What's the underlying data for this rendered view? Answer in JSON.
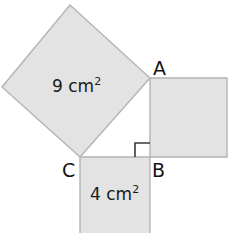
{
  "diagram": {
    "background_color": "#ffffff",
    "shape_fill": "#e3e3e3",
    "shape_stroke": "#b4b4b4",
    "label_color": "#141414",
    "squares": [
      {
        "name": "hypotenuse-square",
        "label": "9 cm",
        "exponent": "2",
        "points": "70,5 150,78 80,157 2,87",
        "label_x": 52,
        "label_y": 92
      },
      {
        "name": "vertical-leg-square",
        "label": "",
        "exponent": "",
        "points": "150,78 227,78 227,157 150,157",
        "label_x": 0,
        "label_y": 0
      },
      {
        "name": "horizontal-leg-square",
        "label": "4 cm",
        "exponent": "2",
        "points": "80,157 150,157 150,236 80,236",
        "label_x": 90,
        "label_y": 200
      }
    ],
    "right_angle_marker": {
      "name": "right-angle-marker",
      "path": "M 135,157 L 135,143 L 150,143"
    },
    "vertices": [
      {
        "name": "vertex-a",
        "label": "A",
        "x": 153,
        "y": 75
      },
      {
        "name": "vertex-b",
        "label": "B",
        "x": 152,
        "y": 177
      },
      {
        "name": "vertex-c",
        "label": "C",
        "x": 62,
        "y": 177
      }
    ]
  }
}
